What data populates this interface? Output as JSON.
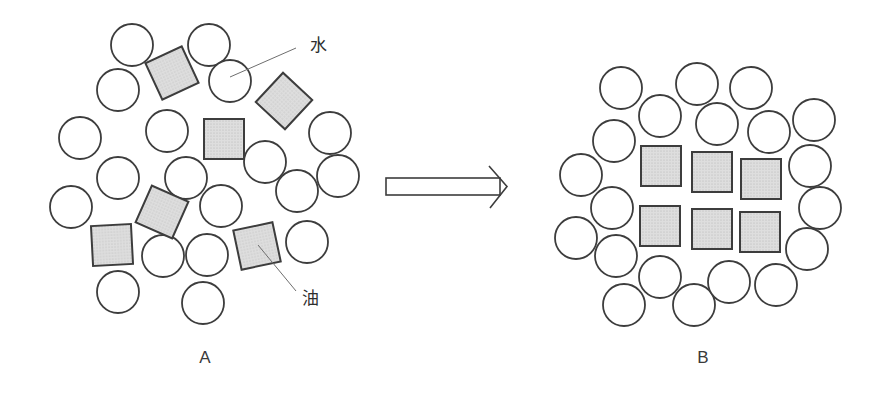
{
  "labels": {
    "water": "水",
    "oil": "油",
    "panel_a": "A",
    "panel_b": "B"
  },
  "colors": {
    "stroke": "#3d3d3d",
    "square_fill": "#dedede",
    "square_dot": "#b5b5b5",
    "background": "#ffffff",
    "leader_line": "#6e6e6e",
    "text": "#2e2e2e"
  },
  "geometry": {
    "circle_radius": 21,
    "square_size": 40
  },
  "panel_a": {
    "circles": [
      [
        132,
        45
      ],
      [
        209,
        45
      ],
      [
        230,
        81
      ],
      [
        118,
        90
      ],
      [
        167,
        131
      ],
      [
        80,
        138
      ],
      [
        330,
        133
      ],
      [
        265,
        162
      ],
      [
        118,
        178
      ],
      [
        186,
        178
      ],
      [
        338,
        176
      ],
      [
        297,
        191
      ],
      [
        71,
        207
      ],
      [
        221,
        206
      ],
      [
        307,
        242
      ],
      [
        163,
        256
      ],
      [
        207,
        255
      ],
      [
        118,
        292
      ],
      [
        203,
        303
      ]
    ],
    "squares": [
      [
        172,
        73,
        -25
      ],
      [
        284,
        101,
        43
      ],
      [
        224,
        139,
        0
      ],
      [
        162,
        212,
        24
      ],
      [
        112,
        245,
        -3
      ],
      [
        257,
        246,
        -12
      ]
    ]
  },
  "panel_b": {
    "circles": [
      [
        621,
        88
      ],
      [
        660,
        116
      ],
      [
        697,
        84
      ],
      [
        717,
        124
      ],
      [
        751,
        88
      ],
      [
        769,
        132
      ],
      [
        814,
        120
      ],
      [
        810,
        166
      ],
      [
        820,
        208
      ],
      [
        807,
        249
      ],
      [
        614,
        141
      ],
      [
        581,
        175
      ],
      [
        612,
        208
      ],
      [
        576,
        238
      ],
      [
        616,
        256
      ],
      [
        660,
        277
      ],
      [
        624,
        305
      ],
      [
        694,
        305
      ],
      [
        729,
        282
      ],
      [
        776,
        285
      ]
    ],
    "squares": [
      [
        661,
        166,
        0
      ],
      [
        712,
        172,
        0
      ],
      [
        761,
        179,
        0
      ],
      [
        660,
        226,
        0
      ],
      [
        712,
        229,
        0
      ],
      [
        760,
        232,
        0
      ]
    ]
  }
}
